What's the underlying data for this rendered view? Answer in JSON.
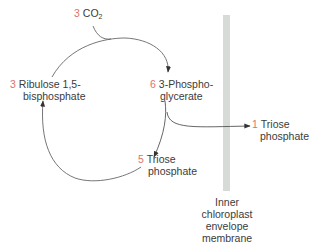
{
  "colors": {
    "stoichiometry_number": "#e0716b",
    "text": "#3b3b3b",
    "arrow": "#555555",
    "membrane": "#d6dbd8"
  },
  "nodes": {
    "co2": {
      "count": "3",
      "name": "CO",
      "subscript": "2"
    },
    "ribulose": {
      "count": "3",
      "line1": "Ribulose 1,5-",
      "line2": "bisphosphate"
    },
    "phosphoglycerate": {
      "count": "6",
      "line1": "3-Phospho-",
      "line2": "glycerate"
    },
    "triose_recycled": {
      "count": "5",
      "line1": "Triose",
      "line2": "phosphate"
    },
    "triose_exported": {
      "count": "1",
      "line1": "Triose",
      "line2": "phosphate"
    }
  },
  "membrane": {
    "line1": "Inner",
    "line2": "chloroplast",
    "line3": "envelope",
    "line4": "membrane"
  },
  "edges": [
    {
      "from": "co2",
      "to": "phosphoglycerate",
      "label": "CO2 joins cycle"
    },
    {
      "from": "ribulose",
      "to": "phosphoglycerate",
      "label": "carboxylation"
    },
    {
      "from": "phosphoglycerate",
      "to": "triose_recycled",
      "label": "reduction"
    },
    {
      "from": "phosphoglycerate",
      "to": "triose_exported",
      "label": "export across membrane"
    },
    {
      "from": "triose_recycled",
      "to": "ribulose",
      "label": "regeneration"
    }
  ]
}
